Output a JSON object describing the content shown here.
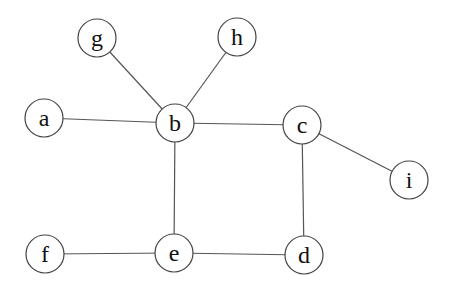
{
  "diagram": {
    "type": "undirected-graph",
    "nodes": [
      {
        "id": "a",
        "label": "a",
        "x": 44,
        "y": 118
      },
      {
        "id": "b",
        "label": "b",
        "x": 175,
        "y": 123
      },
      {
        "id": "c",
        "label": "c",
        "x": 302,
        "y": 125
      },
      {
        "id": "d",
        "label": "d",
        "x": 304,
        "y": 255
      },
      {
        "id": "e",
        "label": "e",
        "x": 174,
        "y": 253
      },
      {
        "id": "f",
        "label": "f",
        "x": 45,
        "y": 254
      },
      {
        "id": "g",
        "label": "g",
        "x": 97,
        "y": 38
      },
      {
        "id": "h",
        "label": "h",
        "x": 237,
        "y": 37
      },
      {
        "id": "i",
        "label": "i",
        "x": 409,
        "y": 180
      }
    ],
    "edges": [
      [
        "a",
        "b"
      ],
      [
        "g",
        "b"
      ],
      [
        "h",
        "b"
      ],
      [
        "b",
        "c"
      ],
      [
        "b",
        "e"
      ],
      [
        "c",
        "d"
      ],
      [
        "c",
        "i"
      ],
      [
        "f",
        "e"
      ],
      [
        "e",
        "d"
      ]
    ],
    "node_radius": 19
  }
}
